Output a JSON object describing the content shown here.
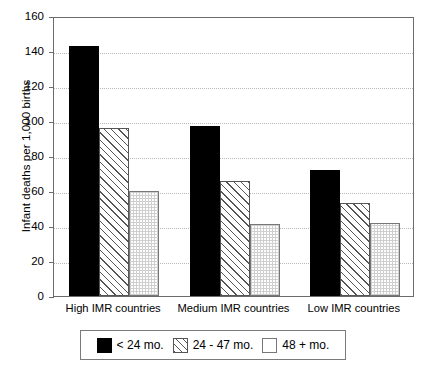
{
  "chart_data": {
    "type": "bar",
    "title": "",
    "xlabel": "",
    "ylabel": "Infant deaths per 1,000 births",
    "ylim": [
      0,
      160
    ],
    "yticks": [
      0,
      20,
      40,
      60,
      80,
      100,
      120,
      140,
      160
    ],
    "grid": true,
    "legend_position": "bottom",
    "categories": [
      "High IMR countries",
      "Medium IMR countries",
      "Low IMR countries"
    ],
    "series": [
      {
        "name": "< 24 mo.",
        "values": [
          143,
          97,
          72
        ]
      },
      {
        "name": "24 - 47 mo.",
        "values": [
          96,
          66,
          53
        ]
      },
      {
        "name": "48 + mo.",
        "values": [
          60,
          41,
          42
        ]
      }
    ],
    "colors": {
      "series_0": "#000000",
      "series_1": "#ffffff",
      "series_2": "#ffffff",
      "axis": "#6b6b6b",
      "grid": "#b9b9b9",
      "background": "#ffffff"
    },
    "fills": {
      "series_0": "solid-black",
      "series_1": "diagonal-hatch",
      "series_2": "fine-dotted-grid"
    }
  }
}
